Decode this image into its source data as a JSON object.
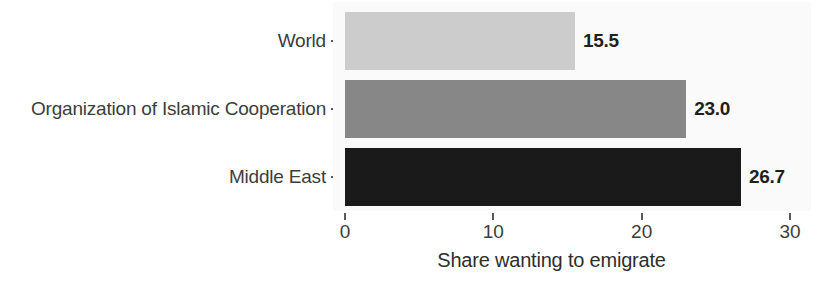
{
  "chart_data": {
    "type": "bar",
    "orientation": "horizontal",
    "title": "",
    "xlabel": "Share wanting to emigrate",
    "ylabel": "",
    "categories": [
      "World",
      "Organization of Islamic Cooperation",
      "Middle East"
    ],
    "values": [
      15.5,
      23.0,
      26.7
    ],
    "value_labels": [
      "15.5",
      "23.0",
      "26.7"
    ],
    "bar_colors": [
      "#cccccc",
      "#878787",
      "#1a1a1a"
    ],
    "xlim": [
      0,
      30
    ],
    "xticks": [
      0,
      10,
      20,
      30
    ],
    "xtick_labels": [
      "0",
      "10",
      "20",
      "30"
    ],
    "grid": false,
    "legend": "none",
    "panel_background": "#fafafa",
    "figure_background": "#ffffff"
  },
  "axis": {
    "x_title": "Share wanting to emigrate",
    "ticks": [
      {
        "label": "0",
        "value": 0
      },
      {
        "label": "10",
        "value": 10
      },
      {
        "label": "20",
        "value": 20
      },
      {
        "label": "30",
        "value": 30
      }
    ]
  },
  "bars": [
    {
      "label": "World",
      "value": 15.5,
      "value_label": "15.5",
      "color": "#cccccc"
    },
    {
      "label": "Organization of Islamic Cooperation",
      "value": 23.0,
      "value_label": "23.0",
      "color": "#878787"
    },
    {
      "label": "Middle East",
      "value": 26.7,
      "value_label": "26.7",
      "color": "#1a1a1a"
    }
  ]
}
